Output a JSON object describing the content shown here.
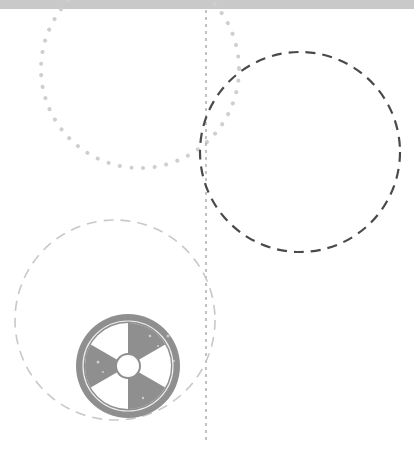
{
  "canvas": {
    "width": 414,
    "height": 451,
    "background": "#ffffff"
  },
  "topbar": {
    "color": "#c9c9c9",
    "height": 9
  },
  "shapes": {
    "dotted_circle": {
      "cx": 140,
      "cy": 69,
      "r": 99,
      "stroke": "#cfcfcf"
    },
    "dark_dashed_circle": {
      "cx": 300,
      "cy": 152,
      "r": 100,
      "stroke": "#4a4a4a"
    },
    "light_dashed_circle": {
      "cx": 115,
      "cy": 320,
      "r": 100,
      "stroke": "#c8c8c8"
    },
    "divider_line": {
      "x": 206,
      "y1": 10,
      "y2": 440,
      "stroke": "#9a9a9a"
    }
  },
  "icon": {
    "name": "radiation-trefoil-icon",
    "cx": 128,
    "cy": 366,
    "r": 52,
    "color": "#8f8f8f"
  }
}
